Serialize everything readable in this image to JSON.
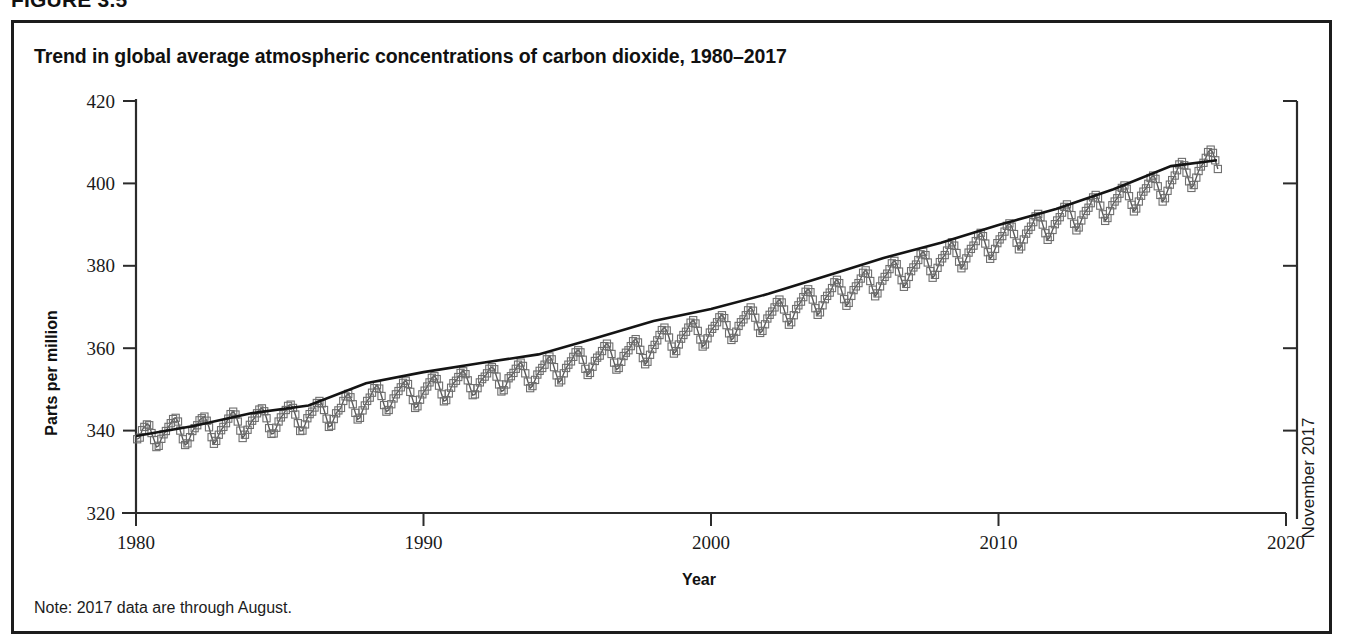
{
  "figure": {
    "number_label": "FIGURE 3.5",
    "title": "Trend in global average atmospheric concentrations of carbon dioxide, 1980–2017",
    "note": "Note: 2017 data are through August."
  },
  "annotations": {
    "right_axis_label": "November 2017"
  },
  "chart_data": {
    "type": "line",
    "title": "Trend in global average atmospheric concentrations of carbon dioxide, 1980–2017",
    "xlabel": "Year",
    "ylabel": "Parts per million",
    "xlim": [
      1980,
      2020
    ],
    "ylim": [
      320,
      420
    ],
    "xticks": [
      1980,
      1990,
      2000,
      2010,
      2020
    ],
    "yticks": [
      320,
      340,
      360,
      380,
      400,
      420
    ],
    "grid": false,
    "legend": null,
    "marker": "open-square",
    "series": [
      {
        "name": "Monthly average CO2 concentration",
        "units": "ppm",
        "x": [
          1980.04,
          1980.13,
          1980.21,
          1980.29,
          1980.38,
          1980.46,
          1980.54,
          1980.63,
          1980.71,
          1980.79,
          1980.88,
          1980.96,
          1981.04,
          1981.13,
          1981.21,
          1981.29,
          1981.38,
          1981.46,
          1981.54,
          1981.63,
          1981.71,
          1981.79,
          1981.88,
          1981.96,
          1982.04,
          1982.13,
          1982.21,
          1982.29,
          1982.38,
          1982.46,
          1982.54,
          1982.63,
          1982.71,
          1982.79,
          1982.88,
          1982.96,
          1983.04,
          1983.13,
          1983.21,
          1983.29,
          1983.38,
          1983.46,
          1983.54,
          1983.63,
          1983.71,
          1983.79,
          1983.88,
          1983.96,
          1984.04,
          1984.13,
          1984.21,
          1984.29,
          1984.38,
          1984.46,
          1984.54,
          1984.63,
          1984.71,
          1984.79,
          1984.88,
          1984.96,
          1985.04,
          1985.13,
          1985.21,
          1985.29,
          1985.38,
          1985.46,
          1985.54,
          1985.63,
          1985.71,
          1985.79,
          1985.88,
          1985.96,
          1986.04,
          1986.13,
          1986.21,
          1986.29,
          1986.38,
          1986.46,
          1986.54,
          1986.63,
          1986.71,
          1986.79,
          1986.88,
          1986.96,
          1987.04,
          1987.13,
          1987.21,
          1987.29,
          1987.38,
          1987.46,
          1987.54,
          1987.63,
          1987.71,
          1987.79,
          1987.88,
          1987.96,
          1988.04,
          1988.13,
          1988.21,
          1988.29,
          1988.38,
          1988.46,
          1988.54,
          1988.63,
          1988.71,
          1988.79,
          1988.88,
          1988.96,
          1989.04,
          1989.13,
          1989.21,
          1989.29,
          1989.38,
          1989.46,
          1989.54,
          1989.63,
          1989.71,
          1989.79,
          1989.88,
          1989.96,
          1990.04,
          1990.13,
          1990.21,
          1990.29,
          1990.38,
          1990.46,
          1990.54,
          1990.63,
          1990.71,
          1990.79,
          1990.88,
          1990.96,
          1991.04,
          1991.13,
          1991.21,
          1991.29,
          1991.38,
          1991.46,
          1991.54,
          1991.63,
          1991.71,
          1991.79,
          1991.88,
          1991.96,
          1992.04,
          1992.13,
          1992.21,
          1992.29,
          1992.38,
          1992.46,
          1992.54,
          1992.63,
          1992.71,
          1992.79,
          1992.88,
          1992.96,
          1993.04,
          1993.13,
          1993.21,
          1993.29,
          1993.38,
          1993.46,
          1993.54,
          1993.63,
          1993.71,
          1993.79,
          1993.88,
          1993.96,
          1994.04,
          1994.13,
          1994.21,
          1994.29,
          1994.38,
          1994.46,
          1994.54,
          1994.63,
          1994.71,
          1994.79,
          1994.88,
          1994.96,
          1995.04,
          1995.13,
          1995.21,
          1995.29,
          1995.38,
          1995.46,
          1995.54,
          1995.63,
          1995.71,
          1995.79,
          1995.88,
          1995.96,
          1996.04,
          1996.13,
          1996.21,
          1996.29,
          1996.38,
          1996.46,
          1996.54,
          1996.63,
          1996.71,
          1996.79,
          1996.88,
          1996.96,
          1997.04,
          1997.13,
          1997.21,
          1997.29,
          1997.38,
          1997.46,
          1997.54,
          1997.63,
          1997.71,
          1997.79,
          1997.88,
          1997.96,
          1998.04,
          1998.13,
          1998.21,
          1998.29,
          1998.38,
          1998.46,
          1998.54,
          1998.63,
          1998.71,
          1998.79,
          1998.88,
          1998.96,
          1999.04,
          1999.13,
          1999.21,
          1999.29,
          1999.38,
          1999.46,
          1999.54,
          1999.63,
          1999.71,
          1999.79,
          1999.88,
          1999.96,
          2000.04,
          2000.13,
          2000.21,
          2000.29,
          2000.38,
          2000.46,
          2000.54,
          2000.63,
          2000.71,
          2000.79,
          2000.88,
          2000.96,
          2001.04,
          2001.13,
          2001.21,
          2001.29,
          2001.38,
          2001.46,
          2001.54,
          2001.63,
          2001.71,
          2001.79,
          2001.88,
          2001.96,
          2002.04,
          2002.13,
          2002.21,
          2002.29,
          2002.38,
          2002.46,
          2002.54,
          2002.63,
          2002.71,
          2002.79,
          2002.88,
          2002.96,
          2003.04,
          2003.13,
          2003.21,
          2003.29,
          2003.38,
          2003.46,
          2003.54,
          2003.63,
          2003.71,
          2003.79,
          2003.88,
          2003.96,
          2004.04,
          2004.13,
          2004.21,
          2004.29,
          2004.38,
          2004.46,
          2004.54,
          2004.63,
          2004.71,
          2004.79,
          2004.88,
          2004.96,
          2005.04,
          2005.13,
          2005.21,
          2005.29,
          2005.38,
          2005.46,
          2005.54,
          2005.63,
          2005.71,
          2005.79,
          2005.88,
          2005.96,
          2006.04,
          2006.13,
          2006.21,
          2006.29,
          2006.38,
          2006.46,
          2006.54,
          2006.63,
          2006.71,
          2006.79,
          2006.88,
          2006.96,
          2007.04,
          2007.13,
          2007.21,
          2007.29,
          2007.38,
          2007.46,
          2007.54,
          2007.63,
          2007.71,
          2007.79,
          2007.88,
          2007.96,
          2008.04,
          2008.13,
          2008.21,
          2008.29,
          2008.38,
          2008.46,
          2008.54,
          2008.63,
          2008.71,
          2008.79,
          2008.88,
          2008.96,
          2009.04,
          2009.13,
          2009.21,
          2009.29,
          2009.38,
          2009.46,
          2009.54,
          2009.63,
          2009.71,
          2009.79,
          2009.88,
          2009.96,
          2010.04,
          2010.13,
          2010.21,
          2010.29,
          2010.38,
          2010.46,
          2010.54,
          2010.63,
          2010.71,
          2010.79,
          2010.88,
          2010.96,
          2011.04,
          2011.13,
          2011.21,
          2011.29,
          2011.38,
          2011.46,
          2011.54,
          2011.63,
          2011.71,
          2011.79,
          2011.88,
          2011.96,
          2012.04,
          2012.13,
          2012.21,
          2012.29,
          2012.38,
          2012.46,
          2012.54,
          2012.63,
          2012.71,
          2012.79,
          2012.88,
          2012.96,
          2013.04,
          2013.13,
          2013.21,
          2013.29,
          2013.38,
          2013.46,
          2013.54,
          2013.63,
          2013.71,
          2013.79,
          2013.88,
          2013.96,
          2014.04,
          2014.13,
          2014.21,
          2014.29,
          2014.38,
          2014.46,
          2014.54,
          2014.63,
          2014.71,
          2014.79,
          2014.88,
          2014.96,
          2015.04,
          2015.13,
          2015.21,
          2015.29,
          2015.38,
          2015.46,
          2015.54,
          2015.63,
          2015.71,
          2015.79,
          2015.88,
          2015.96,
          2016.04,
          2016.13,
          2016.21,
          2016.29,
          2016.38,
          2016.46,
          2016.54,
          2016.63,
          2016.71,
          2016.79,
          2016.88,
          2016.96,
          2017.04,
          2017.13,
          2017.21,
          2017.29,
          2017.38,
          2017.46,
          2017.54,
          2017.63
        ],
        "y": [
          337.9,
          338.3,
          340.1,
          340.9,
          341.5,
          341.3,
          339.4,
          337.7,
          336.0,
          336.3,
          338.0,
          339.1,
          339.9,
          340.9,
          341.8,
          342.8,
          343.1,
          342.2,
          340.0,
          337.9,
          336.5,
          336.9,
          338.4,
          339.9,
          340.6,
          341.3,
          342.5,
          343.0,
          343.4,
          342.4,
          340.8,
          338.4,
          336.8,
          337.5,
          339.0,
          340.1,
          340.9,
          341.8,
          342.9,
          344.0,
          344.6,
          343.9,
          342.2,
          340.0,
          338.2,
          339.0,
          340.2,
          341.4,
          342.4,
          343.1,
          344.2,
          345.1,
          345.4,
          344.7,
          343.0,
          340.6,
          339.2,
          339.3,
          340.7,
          342.2,
          343.2,
          344.0,
          345.0,
          346.0,
          346.3,
          345.5,
          343.9,
          341.8,
          339.9,
          340.0,
          341.5,
          343.0,
          344.0,
          344.6,
          345.6,
          346.7,
          347.2,
          346.6,
          345.0,
          342.9,
          340.9,
          341.2,
          342.8,
          344.2,
          344.9,
          345.5,
          347.2,
          348.3,
          348.9,
          348.1,
          346.4,
          344.3,
          342.7,
          343.1,
          344.9,
          346.1,
          347.2,
          348.0,
          349.2,
          350.3,
          351.0,
          350.2,
          348.4,
          346.2,
          344.6,
          345.0,
          346.4,
          347.8,
          348.8,
          349.6,
          350.5,
          351.6,
          352.1,
          351.3,
          349.4,
          347.4,
          345.5,
          345.9,
          347.5,
          348.8,
          349.7,
          350.7,
          351.7,
          352.8,
          353.2,
          352.5,
          350.9,
          348.8,
          347.1,
          347.4,
          349.0,
          350.4,
          351.5,
          352.1,
          353.0,
          354.0,
          354.4,
          353.7,
          352.2,
          350.3,
          348.6,
          348.8,
          350.3,
          351.7,
          352.5,
          353.1,
          353.9,
          355.0,
          355.4,
          354.9,
          353.1,
          351.2,
          349.5,
          349.8,
          351.2,
          352.7,
          353.2,
          354.0,
          355.0,
          356.0,
          356.5,
          355.7,
          353.9,
          351.9,
          350.3,
          350.8,
          352.3,
          353.6,
          354.5,
          355.2,
          356.0,
          357.3,
          358.0,
          357.3,
          355.4,
          353.4,
          351.7,
          352.2,
          353.9,
          355.2,
          356.0,
          356.8,
          357.9,
          359.0,
          359.5,
          359.0,
          357.2,
          355.0,
          353.5,
          354.0,
          355.5,
          356.9,
          357.7,
          358.2,
          359.3,
          360.5,
          361.1,
          360.4,
          358.6,
          356.5,
          354.8,
          355.2,
          356.7,
          358.1,
          358.9,
          359.5,
          360.5,
          361.7,
          362.2,
          361.4,
          359.6,
          357.6,
          356.1,
          356.7,
          358.4,
          359.8,
          360.8,
          361.9,
          363.2,
          364.4,
          365.0,
          364.3,
          362.6,
          360.4,
          358.7,
          359.3,
          360.9,
          362.3,
          363.2,
          364.0,
          365.0,
          366.2,
          366.8,
          366.0,
          364.2,
          362.1,
          360.4,
          360.9,
          362.4,
          363.8,
          364.7,
          365.4,
          366.3,
          367.5,
          368.0,
          367.3,
          365.6,
          363.6,
          362.0,
          362.5,
          364.0,
          365.4,
          366.3,
          367.0,
          368.0,
          369.2,
          369.9,
          369.1,
          367.4,
          365.3,
          363.7,
          364.2,
          365.8,
          367.2,
          368.1,
          368.9,
          369.9,
          371.2,
          371.8,
          371.1,
          369.4,
          367.3,
          365.7,
          366.3,
          368.0,
          369.5,
          370.4,
          371.3,
          372.4,
          373.7,
          374.3,
          373.6,
          371.8,
          369.7,
          368.1,
          368.7,
          370.4,
          371.9,
          372.7,
          373.5,
          374.6,
          376.0,
          376.6,
          375.8,
          374.0,
          371.9,
          370.3,
          371.0,
          372.7,
          374.1,
          375.0,
          375.8,
          376.9,
          378.3,
          378.9,
          378.1,
          376.3,
          374.2,
          372.6,
          373.3,
          375.0,
          376.4,
          377.3,
          378.1,
          379.2,
          380.6,
          381.2,
          380.4,
          378.6,
          376.5,
          374.9,
          375.6,
          377.3,
          378.7,
          379.6,
          380.3,
          381.4,
          382.8,
          383.4,
          382.6,
          380.8,
          378.7,
          377.1,
          377.8,
          379.5,
          380.9,
          381.8,
          382.6,
          383.7,
          385.1,
          385.7,
          384.9,
          383.1,
          381.0,
          379.4,
          380.1,
          381.8,
          383.2,
          384.1,
          384.9,
          386.0,
          387.4,
          388.0,
          387.2,
          385.4,
          383.3,
          381.7,
          382.4,
          384.1,
          385.5,
          386.4,
          387.2,
          388.3,
          389.7,
          390.3,
          389.5,
          387.7,
          385.6,
          384.0,
          384.7,
          386.4,
          387.8,
          388.7,
          389.5,
          390.6,
          392.0,
          392.6,
          391.8,
          390.0,
          387.9,
          386.3,
          387.0,
          388.7,
          390.1,
          391.0,
          391.8,
          392.9,
          394.3,
          394.9,
          394.1,
          392.3,
          390.2,
          388.6,
          389.3,
          391.0,
          392.4,
          393.3,
          394.1,
          395.2,
          396.6,
          397.2,
          396.4,
          394.6,
          392.5,
          390.9,
          391.6,
          393.3,
          394.7,
          395.6,
          396.4,
          397.5,
          398.9,
          399.5,
          398.7,
          396.9,
          394.8,
          393.2,
          393.9,
          395.6,
          397.0,
          398.0,
          398.8,
          399.9,
          401.3,
          401.9,
          401.1,
          399.3,
          397.2,
          395.6,
          396.4,
          398.2,
          399.7,
          400.8,
          401.9,
          403.2,
          404.6,
          405.2,
          404.4,
          402.6,
          400.5,
          398.9,
          399.6,
          401.4,
          403.0,
          404.1,
          405.0,
          406.2,
          407.6,
          408.2,
          407.4,
          405.6,
          403.5
        ]
      },
      {
        "name": "Smoothed trend",
        "units": "ppm",
        "x": [
          1980,
          1982,
          1984,
          1986,
          1988,
          1990,
          1992,
          1994,
          1996,
          1998,
          2000,
          2002,
          2004,
          2006,
          2008,
          2010,
          2012,
          2014,
          2016,
          2017.6
        ],
        "y": [
          338.7,
          341.1,
          344.2,
          346.1,
          351.5,
          354.2,
          356.4,
          358.5,
          362.5,
          366.6,
          369.5,
          373.2,
          377.5,
          381.9,
          385.6,
          389.9,
          393.8,
          398.6,
          404.2,
          405.6
        ]
      }
    ]
  }
}
